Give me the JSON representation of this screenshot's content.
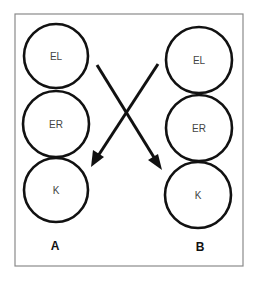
{
  "diagram": {
    "frame": {
      "x": 15,
      "y": 14,
      "width": 228,
      "height": 252,
      "stroke": "#8a8a8a"
    },
    "columns": [
      {
        "label": "A",
        "label_pos": {
          "x": 55,
          "y": 246
        },
        "circles": [
          {
            "label": "EL",
            "cx": 56,
            "cy": 56,
            "r": 32
          },
          {
            "label": "ER",
            "cx": 56,
            "cy": 124,
            "r": 33
          },
          {
            "label": "K",
            "cx": 56,
            "cy": 190,
            "r": 32
          }
        ]
      },
      {
        "label": "B",
        "label_pos": {
          "x": 200,
          "y": 247
        },
        "circles": [
          {
            "label": "EL",
            "cx": 199,
            "cy": 60,
            "r": 33
          },
          {
            "label": "ER",
            "cx": 199,
            "cy": 128,
            "r": 33
          },
          {
            "label": "K",
            "cx": 198,
            "cy": 195,
            "r": 33
          }
        ]
      }
    ],
    "arrows": [
      {
        "from": "A-EL",
        "to": "B-K",
        "x1": 97,
        "y1": 65,
        "x2": 162,
        "y2": 170
      },
      {
        "from": "B-EL",
        "to": "A-K",
        "x1": 158,
        "y1": 64,
        "x2": 91,
        "y2": 167
      }
    ],
    "colors": {
      "ink": "#111111",
      "label": "#444444",
      "frame": "#8a8a8a"
    }
  }
}
